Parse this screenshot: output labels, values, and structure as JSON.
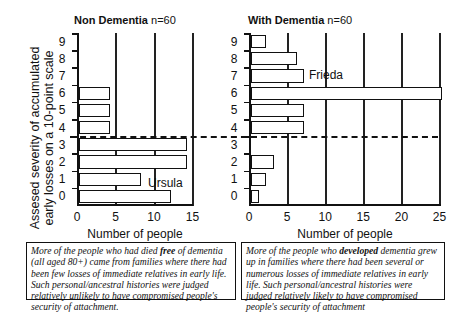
{
  "figure": {
    "ylabel_line1": "Assesed severity of accumulated",
    "ylabel_line2": "early losses on a 10-point scale",
    "left_panel": {
      "title_bold": "Non Dementia",
      "title_n": "n=60",
      "xlabel": "Number of people",
      "x_ticks": [
        "0",
        "5",
        "10",
        "15"
      ],
      "annotation": "Ursula"
    },
    "right_panel": {
      "title_bold": "With Dementia",
      "title_n": "n=60",
      "xlabel": "Number of people",
      "x_ticks": [
        "0",
        "5",
        "10",
        "15",
        "20",
        "25"
      ],
      "annotation": "Frieda"
    },
    "y_ticks": [
      "9",
      "8",
      "7",
      "6",
      "5",
      "4",
      "3",
      "2",
      "1",
      "0"
    ],
    "left_caption": {
      "pre": "More of the people who had died ",
      "bold": "free",
      "post": " of dementia (all aged 80+) came from families where there had been few losses of immediate relatives in early life. Such personal/ancestral histories were judged relatively unlikely  to have compromised people's security of attachment."
    },
    "right_caption": {
      "pre": "More of the people who ",
      "bold": "developed",
      "post": " dementia grew up in families where there had been several or numerous losses of immediate relatives in early life. Such personal/ancestral histories were judged relatively likely to have compromised people's security of attachment"
    }
  },
  "chart_data": [
    {
      "type": "bar",
      "orientation": "horizontal",
      "title": "Non Dementia n=60",
      "categories": [
        "0",
        "1",
        "2",
        "3",
        "4",
        "5",
        "6",
        "7",
        "8",
        "9"
      ],
      "values": [
        12,
        8,
        14,
        14,
        4,
        4,
        4,
        0,
        0,
        0
      ],
      "xlabel": "Number of people",
      "ylabel": "Assesed severity of accumulated early losses on a 10-point scale",
      "xlim": [
        0,
        15
      ],
      "x_ticks": [
        0,
        5,
        10,
        15
      ],
      "grid": "vertical gridlines at 5, 10, 15",
      "annotations": [
        {
          "text": "Ursula",
          "at_category": "2"
        }
      ],
      "threshold_line": {
        "style": "dashed",
        "between": [
          "3",
          "4"
        ]
      }
    },
    {
      "type": "bar",
      "orientation": "horizontal",
      "title": "With Dementia n=60",
      "categories": [
        "0",
        "1",
        "2",
        "3",
        "4",
        "5",
        "6",
        "7",
        "8",
        "9"
      ],
      "values": [
        1,
        2,
        3,
        0,
        7,
        7,
        25,
        7,
        6,
        2
      ],
      "xlabel": "Number of people",
      "ylabel": "Assesed severity of accumulated early losses on a 10-point scale",
      "xlim": [
        0,
        25
      ],
      "x_ticks": [
        0,
        5,
        10,
        15,
        20,
        25
      ],
      "grid": "vertical gridlines at 5, 10, 15, 20, 25",
      "annotations": [
        {
          "text": "Frieda",
          "at_category": "7"
        }
      ],
      "threshold_line": {
        "style": "dashed",
        "between": [
          "3",
          "4"
        ]
      }
    }
  ]
}
